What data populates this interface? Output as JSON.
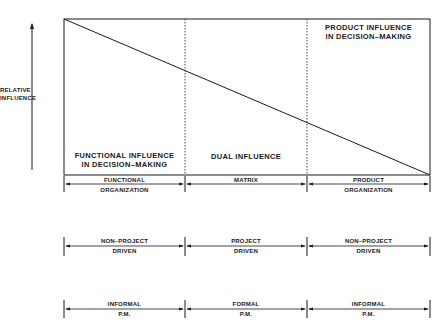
{
  "diagram": {
    "y_axis_label": [
      "RELATIVE",
      "INFLUENCE"
    ],
    "regions": [
      {
        "label": [
          "FUNCTIONAL INFLUENCE",
          "IN DECISION–MAKING"
        ]
      },
      {
        "label": [
          "DUAL INFLUENCE"
        ]
      },
      {
        "label": [
          "PRODUCT INFLUENCE",
          "IN DECISION–MAKING"
        ]
      }
    ],
    "rows": [
      {
        "name": "organization",
        "segments": [
          {
            "label": [
              "FUNCTIONAL",
              "ORGANIZATION"
            ]
          },
          {
            "label": [
              "MATRIX"
            ]
          },
          {
            "label": [
              "PRODUCT",
              "ORGANIZATION"
            ]
          }
        ]
      },
      {
        "name": "drive",
        "segments": [
          {
            "label": [
              "NON–PROJECT",
              "DRIVEN"
            ]
          },
          {
            "label": [
              "PROJECT",
              "DRIVEN"
            ]
          },
          {
            "label": [
              "NON–PROJECT",
              "DRIVEN"
            ]
          }
        ]
      },
      {
        "name": "project-management",
        "segments": [
          {
            "label": [
              "INFORMAL",
              "P.M."
            ]
          },
          {
            "label": [
              "FORMAL",
              "P.M."
            ]
          },
          {
            "label": [
              "INFORMAL",
              "P.M."
            ]
          }
        ]
      }
    ],
    "colors": {
      "ink": "#1a1a1a",
      "background": "#ffffff"
    }
  }
}
